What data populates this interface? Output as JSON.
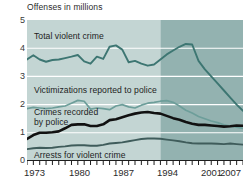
{
  "chart_data": {
    "type": "line",
    "title": "Offenses in millions",
    "xlabel": "",
    "ylabel": "Offenses in millions",
    "ylim": [
      0,
      5
    ],
    "xlim": [
      1973,
      2007
    ],
    "ytick_labels": [
      "0",
      "1",
      "2",
      "3",
      "4",
      "5"
    ],
    "ytick_values": [
      0,
      1,
      2,
      3,
      4,
      5
    ],
    "xtick_labels": [
      "1973",
      "1980",
      "1987",
      "1994",
      "2001",
      "2007"
    ],
    "xtick_values": [
      1973,
      1980,
      1987,
      1994,
      2001,
      2007
    ],
    "grid": "horizontal-white",
    "legend": "inline-labels",
    "shading": {
      "light_band_label": "1973-1993",
      "light_band_color": "#c3d5d3",
      "dark_band_label": "1994-2007",
      "dark_band_color": "#93b2b0",
      "boundary_year": 1994
    },
    "x": [
      1973,
      1974,
      1975,
      1976,
      1977,
      1978,
      1979,
      1980,
      1981,
      1982,
      1983,
      1984,
      1985,
      1986,
      1987,
      1988,
      1989,
      1990,
      1991,
      1992,
      1993,
      1994,
      1995,
      1996,
      1997,
      1998,
      1999,
      2000,
      2001,
      2002,
      2003,
      2004,
      2005,
      2006,
      2007
    ],
    "series": [
      {
        "name": "Total violent crime",
        "color": "#3d7672",
        "values": [
          3.6,
          3.75,
          3.6,
          3.52,
          3.58,
          3.6,
          3.65,
          3.7,
          3.76,
          3.53,
          3.45,
          3.7,
          3.62,
          4.05,
          4.1,
          3.95,
          3.5,
          3.55,
          3.45,
          3.38,
          3.42,
          3.6,
          3.78,
          3.92,
          4.05,
          4.15,
          4.13,
          3.55,
          3.25,
          3.0,
          2.75,
          2.5,
          2.25,
          2.0,
          1.78
        ],
        "label_text": "Total violent crime"
      },
      {
        "name": "Victimizations reported to police",
        "color": "#6d9e9a",
        "values": [
          1.86,
          1.9,
          1.88,
          1.86,
          1.88,
          1.92,
          1.95,
          2.05,
          2.15,
          2.12,
          1.84,
          1.88,
          1.86,
          1.82,
          1.95,
          2.0,
          1.92,
          1.88,
          1.98,
          2.05,
          2.08,
          2.12,
          2.14,
          2.08,
          1.95,
          1.8,
          1.7,
          1.58,
          1.5,
          1.42,
          1.36,
          1.28,
          1.24,
          1.2,
          1.16
        ],
        "label_text": "Victimizations reported to police"
      },
      {
        "name": "Crimes recorded by police",
        "color": "#111111",
        "values": [
          0.78,
          0.92,
          1.0,
          1.0,
          1.02,
          1.05,
          1.16,
          1.28,
          1.3,
          1.3,
          1.24,
          1.24,
          1.3,
          1.45,
          1.48,
          1.55,
          1.62,
          1.68,
          1.72,
          1.74,
          1.7,
          1.68,
          1.6,
          1.52,
          1.46,
          1.38,
          1.32,
          1.28,
          1.28,
          1.26,
          1.24,
          1.22,
          1.23,
          1.26,
          1.25
        ],
        "label_text": "Crimes recorded\nby police"
      },
      {
        "name": "Arrests for violent crime",
        "color": "#3f5c5b",
        "values": [
          0.42,
          0.45,
          0.47,
          0.46,
          0.47,
          0.5,
          0.52,
          0.55,
          0.56,
          0.56,
          0.54,
          0.54,
          0.57,
          0.62,
          0.64,
          0.66,
          0.7,
          0.74,
          0.78,
          0.8,
          0.8,
          0.79,
          0.76,
          0.73,
          0.7,
          0.66,
          0.63,
          0.62,
          0.62,
          0.62,
          0.61,
          0.6,
          0.62,
          0.6,
          0.58
        ],
        "label_text": "Arrests for violent crime"
      }
    ]
  },
  "axis": {
    "title": "Offenses in millions",
    "y": {
      "t5": "5",
      "t4": "4",
      "t3": "3",
      "t2": "2",
      "t1": "1",
      "t0": "0"
    },
    "x": {
      "t1973": "1973",
      "t1980": "1980",
      "t1987": "1987",
      "t1994": "1994",
      "t2001": "2001",
      "t2007": "2007"
    }
  },
  "labels": {
    "total_violent_crime": "Total violent crime",
    "victimizations_reported": "Victimizations reported to police",
    "crimes_recorded_line1": "Crimes recorded",
    "crimes_recorded_line2": "by police",
    "arrests_violent_crime": "Arrests for violent crime"
  },
  "footnote": {
    "text": ""
  }
}
